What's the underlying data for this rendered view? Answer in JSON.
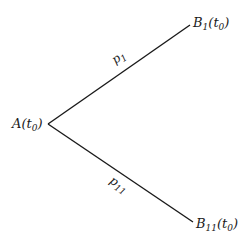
{
  "diagram": {
    "type": "branching-tree",
    "line_color": "#1a1a1a",
    "nodes": {
      "root": {
        "base": "A",
        "sub": "",
        "arg_base": "t",
        "arg_sub": "0"
      },
      "upper": {
        "base": "B",
        "sub": "1",
        "arg_base": "t",
        "arg_sub": "0"
      },
      "lower": {
        "base": "B",
        "sub": "11",
        "arg_base": "t",
        "arg_sub": "0"
      }
    },
    "edges": {
      "upper": {
        "base": "p",
        "sub": "1",
        "from": "root",
        "to": "upper"
      },
      "lower": {
        "base": "p",
        "sub": "11",
        "from": "root",
        "to": "lower"
      }
    }
  }
}
